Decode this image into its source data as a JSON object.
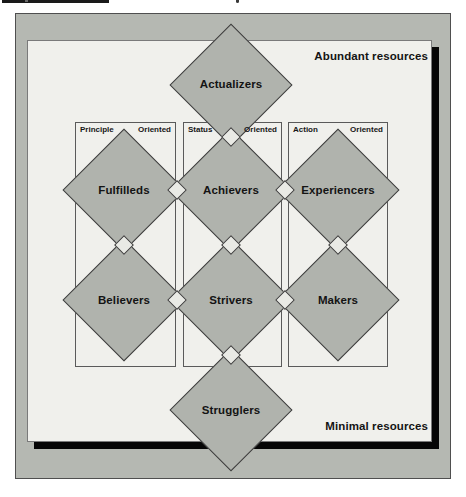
{
  "figure": {
    "resource_top": "Abundant resources",
    "resource_bottom": "Minimal resources",
    "columns": [
      {
        "left": "Principle",
        "right": "Oriented"
      },
      {
        "left": "Status",
        "right": "Oriented"
      },
      {
        "left": "Action",
        "right": "Oriented"
      }
    ],
    "segments": [
      {
        "label": "Actualizers"
      },
      {
        "label": "Fulfilleds"
      },
      {
        "label": "Achievers"
      },
      {
        "label": "Experiencers"
      },
      {
        "label": "Believers"
      },
      {
        "label": "Strivers"
      },
      {
        "label": "Makers"
      },
      {
        "label": "Strugglers"
      }
    ],
    "colors": {
      "frame_fill": "#b5b8b2",
      "diamond_fill": "#b0b3ad",
      "panel_fill": "#f0f0ec",
      "junction_fill": "#e9eae5",
      "line": "#3d3d3d",
      "shadow": "#060606"
    }
  }
}
